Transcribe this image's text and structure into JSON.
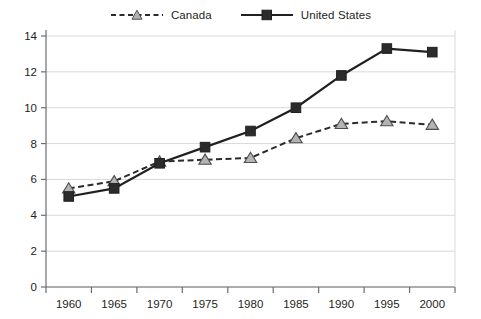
{
  "chart_data": {
    "type": "line",
    "title": "",
    "subtitle": "",
    "xlabel": "",
    "ylabel": "",
    "x": [
      1960,
      1965,
      1970,
      1975,
      1980,
      1985,
      1990,
      1995,
      2000
    ],
    "xtick_labels": [
      "1960",
      "1965",
      "1970",
      "1975",
      "1980",
      "1985",
      "1990",
      "1995",
      "2000"
    ],
    "ytick_labels": [
      "0",
      "2",
      "4",
      "6",
      "8",
      "10",
      "12",
      "14"
    ],
    "yticks": [
      0,
      2,
      4,
      6,
      8,
      10,
      12,
      14
    ],
    "ylim": [
      0,
      14
    ],
    "grid": "horizontal",
    "legend_position": "top-center",
    "series": [
      {
        "name": "Canada",
        "values": [
          5.5,
          5.9,
          7.0,
          7.1,
          7.2,
          8.3,
          9.1,
          9.25,
          9.05
        ],
        "line_style": "dashed",
        "marker": "triangle",
        "line_color": "#2b2b2b",
        "marker_fill": "#b3b3b3",
        "marker_stroke": "#4d4d4d"
      },
      {
        "name": "United States",
        "values": [
          5.05,
          5.5,
          6.9,
          7.8,
          8.7,
          10.0,
          11.8,
          13.3,
          13.1
        ],
        "line_style": "solid",
        "marker": "square",
        "line_color": "#231f20",
        "marker_fill": "#2b2b2b",
        "marker_stroke": "#231f20"
      }
    ]
  },
  "legend": {
    "entries": [
      {
        "label": "Canada",
        "marker_name": "canada-triangle-marker"
      },
      {
        "label": "United States",
        "marker_name": "united-states-square-marker"
      }
    ]
  },
  "colors": {
    "grid": "#d9d9d9",
    "axis": "#6d6e71",
    "text": "#231f20",
    "canada_marker_fill": "#b3b3b3",
    "us_marker_fill": "#2b2b2b"
  }
}
